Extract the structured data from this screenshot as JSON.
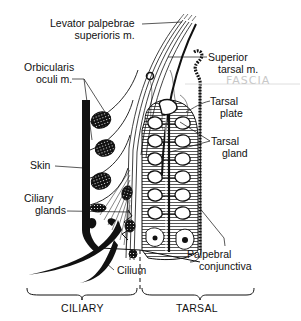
{
  "diagram": {
    "colors": {
      "ink": "#111111",
      "background": "#ffffff",
      "annotation": "#c8c8c8"
    },
    "labels": {
      "levator": {
        "line1": "Levator palpebrae",
        "line2": "superioris m."
      },
      "orbicularis": {
        "line1": "Orbicularis",
        "line2": "oculi m."
      },
      "skin": {
        "line1": "Skin"
      },
      "ciliary_glands": {
        "line1": "Ciliary",
        "line2": "glands"
      },
      "cilium": {
        "line1": "Cilium"
      },
      "superior_tarsal": {
        "line1": "Superior",
        "line2": "tarsal m."
      },
      "tarsal_plate": {
        "line1": "Tarsal",
        "line2": "plate"
      },
      "tarsal_gland": {
        "line1": "Tarsal",
        "line2": "gland"
      },
      "palpebral_conjunctiva": {
        "line1": "Palpebral",
        "line2": "conjunctiva"
      }
    },
    "annotation": {
      "handwritten": "FASCIA"
    },
    "sections": {
      "left": "CILIARY",
      "right": "TARSAL"
    }
  }
}
